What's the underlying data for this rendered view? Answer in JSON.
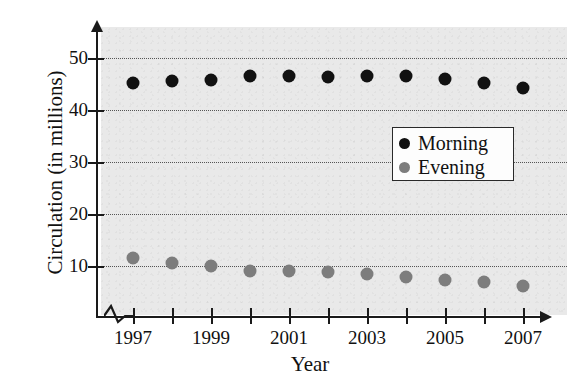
{
  "chart_data": {
    "type": "scatter",
    "title": "",
    "xlabel": "Year",
    "ylabel": "Circulation (in millions)",
    "x": [
      1997,
      1998,
      1999,
      2000,
      2001,
      2002,
      2003,
      2004,
      2005,
      2006,
      2007
    ],
    "xtick_labels": [
      "1997",
      "",
      "1999",
      "",
      "2001",
      "",
      "2003",
      "",
      "2005",
      "",
      "2007"
    ],
    "ytick_labels": [
      "10",
      "20",
      "30",
      "40",
      "50"
    ],
    "yticks": [
      10,
      20,
      30,
      40,
      50
    ],
    "ylim": [
      0,
      55
    ],
    "xlim": [
      1996.5,
      2007.8
    ],
    "grid": "horizontal-dotted",
    "x_axis_break": true,
    "legend_position": "center-right",
    "series": [
      {
        "name": "Morning",
        "color": "#111111",
        "marker": "circle",
        "values": [
          45.2,
          45.5,
          45.8,
          46.5,
          46.6,
          46.4,
          46.6,
          46.6,
          45.9,
          45.2,
          44.3
        ]
      },
      {
        "name": "Evening",
        "color": "#7d7d7d",
        "marker": "circle",
        "values": [
          11.5,
          10.5,
          10.0,
          9.0,
          9.0,
          8.8,
          8.4,
          7.8,
          7.4,
          6.9,
          6.2
        ]
      }
    ]
  },
  "legend": {
    "entries": [
      {
        "label": "Morning",
        "color": "#111111"
      },
      {
        "label": "Evening",
        "color": "#7d7d7d"
      }
    ]
  },
  "axes": {
    "x_title": "Year",
    "y_title": "Circulation (in millions)"
  },
  "colors": {
    "plot_background": "#e9e9e9",
    "axis": "#1a1a1a",
    "gridline": "#555555",
    "morning": "#111111",
    "evening": "#7d7d7d"
  }
}
